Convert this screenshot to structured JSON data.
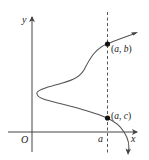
{
  "diagram": {
    "axes": {
      "x_label": "x",
      "y_label": "y",
      "origin_label": "O"
    },
    "vertical_line": {
      "label": "a",
      "style": "dashed"
    },
    "points": [
      {
        "name": "(a, b)",
        "open": "(",
        "v1": "a",
        "sep": ", ",
        "v2": "b",
        "close": ")"
      },
      {
        "name": "(a, c)",
        "open": "(",
        "v1": "a",
        "sep": ", ",
        "v2": "c",
        "close": ")"
      }
    ],
    "colors": {
      "axis": "#333333",
      "curve": "#555555",
      "point": "#111111"
    }
  }
}
